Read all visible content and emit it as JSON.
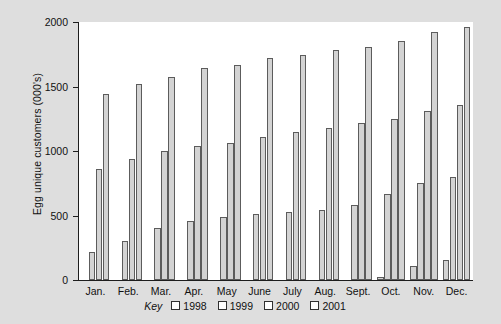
{
  "chart_data": {
    "type": "bar",
    "title": "",
    "xlabel": "",
    "ylabel": "Egg unique customers (000's)",
    "ylim": [
      0,
      2000
    ],
    "ytick_labels": [
      "2000",
      "1500",
      "1000",
      "500",
      "0"
    ],
    "yticks": [
      2000,
      1500,
      1000,
      500,
      0
    ],
    "grid": false,
    "legend_position": "bottom",
    "legend_title": "Key",
    "categories": [
      "Jan.",
      "Feb.",
      "Mar.",
      "Apr.",
      "May",
      "June",
      "July",
      "Aug.",
      "Sept.",
      "Oct.",
      "Nov.",
      "Dec."
    ],
    "series": [
      {
        "name": "1998",
        "values": [
          0,
          0,
          0,
          0,
          0,
          0,
          0,
          0,
          0,
          20,
          105,
          155
        ]
      },
      {
        "name": "1999",
        "values": [
          220,
          300,
          400,
          455,
          485,
          515,
          530,
          545,
          580,
          665,
          755,
          800
        ]
      },
      {
        "name": "2000",
        "values": [
          860,
          940,
          1000,
          1040,
          1065,
          1110,
          1150,
          1175,
          1215,
          1245,
          1310,
          1355
        ]
      },
      {
        "name": "2001",
        "values": [
          1440,
          1520,
          1575,
          1645,
          1670,
          1720,
          1745,
          1785,
          1805,
          1850,
          1925,
          1960
        ]
      }
    ],
    "bar_fill_color": "#d3d3d3",
    "bar_edge_color": "#5c5c5c",
    "plot_background": "#ffffff",
    "figure_background": "#dedede"
  }
}
